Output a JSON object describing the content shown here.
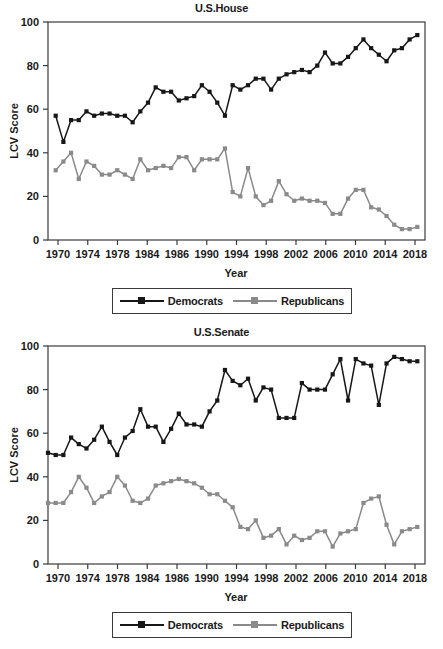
{
  "panels": [
    {
      "id": "house",
      "title": "U.S.House",
      "legend": {
        "dem": "Democrats",
        "rep": "Republicans"
      }
    },
    {
      "id": "senate",
      "title": "U.S.Senate",
      "legend": {
        "dem": "Democrats",
        "rep": "Republicans"
      }
    }
  ],
  "axis": {
    "xlabel": "Year",
    "ylabel": "LCV Score",
    "yticks": [
      "0",
      "20",
      "40",
      "60",
      "80",
      "100"
    ],
    "xticks": [
      "1970",
      "1974",
      "1978",
      "1984",
      "1986",
      "1990",
      "1994",
      "1998",
      "2002",
      "2006",
      "2010",
      "2014",
      "2018"
    ]
  },
  "colors": {
    "democrats": "#171717",
    "republicans": "#8a8a8a",
    "frame": "#3b3b3b",
    "text": "#1a1a1a",
    "background": "#ffffff"
  },
  "chart_data": [
    {
      "type": "line",
      "title": "U.S.House",
      "xlabel": "Year",
      "ylabel": "LCV Score",
      "ylim": [
        0,
        100
      ],
      "xlim": [
        1969,
        2018
      ],
      "grid": false,
      "legend_position": "bottom",
      "x": [
        1970,
        1971,
        1972,
        1973,
        1974,
        1975,
        1976,
        1977,
        1978,
        1979,
        1980,
        1981,
        1982,
        1983,
        1984,
        1985,
        1986,
        1987,
        1988,
        1989,
        1990,
        1991,
        1992,
        1993,
        1994,
        1995,
        1996,
        1997,
        1998,
        1999,
        2000,
        2001,
        2002,
        2003,
        2004,
        2005,
        2006,
        2007,
        2008,
        2009,
        2010,
        2011,
        2012,
        2013,
        2014,
        2015,
        2016,
        2017
      ],
      "series": [
        {
          "name": "Democrats",
          "color": "#171717",
          "values": [
            57,
            45,
            55,
            55,
            59,
            57,
            58,
            58,
            57,
            57,
            54,
            59,
            63,
            70,
            68,
            68,
            64,
            65,
            66,
            71,
            68,
            63,
            57,
            71,
            69,
            71,
            74,
            74,
            69,
            74,
            76,
            77,
            78,
            77,
            80,
            86,
            81,
            81,
            84,
            88,
            92,
            88,
            85,
            82,
            87,
            88,
            92,
            94
          ]
        },
        {
          "name": "Republicans",
          "color": "#8a8a8a",
          "values": [
            32,
            36,
            40,
            28,
            36,
            34,
            30,
            30,
            32,
            30,
            28,
            37,
            32,
            33,
            34,
            33,
            38,
            38,
            32,
            37,
            37,
            37,
            42,
            22,
            20,
            33,
            20,
            16,
            18,
            27,
            21,
            18,
            19,
            18,
            18,
            17,
            12,
            12,
            19,
            23,
            23,
            15,
            14,
            11,
            7,
            5,
            5,
            6
          ]
        }
      ]
    },
    {
      "type": "line",
      "title": "U.S.Senate",
      "xlabel": "Year",
      "ylabel": "LCV Score",
      "ylim": [
        0,
        100
      ],
      "xlim": [
        1969,
        2018
      ],
      "grid": false,
      "legend_position": "bottom",
      "x": [
        1969,
        1970,
        1971,
        1972,
        1973,
        1974,
        1975,
        1976,
        1977,
        1978,
        1979,
        1980,
        1981,
        1982,
        1983,
        1984,
        1985,
        1986,
        1987,
        1988,
        1989,
        1990,
        1991,
        1992,
        1993,
        1994,
        1995,
        1996,
        1997,
        1998,
        1999,
        2000,
        2001,
        2002,
        2003,
        2004,
        2005,
        2006,
        2007,
        2008,
        2009,
        2010,
        2011,
        2012,
        2013,
        2014,
        2015,
        2016,
        2017
      ],
      "series": [
        {
          "name": "Democrats",
          "color": "#171717",
          "values": [
            51,
            50,
            50,
            58,
            55,
            53,
            57,
            63,
            56,
            50,
            58,
            61,
            71,
            63,
            63,
            56,
            62,
            69,
            64,
            64,
            63,
            70,
            75,
            89,
            84,
            82,
            85,
            75,
            81,
            80,
            67,
            67,
            67,
            83,
            80,
            80,
            80,
            87,
            94,
            75,
            94,
            92,
            91,
            73,
            92,
            95,
            94,
            93,
            93
          ]
        },
        {
          "name": "Republicans",
          "color": "#8a8a8a",
          "values": [
            28,
            28,
            28,
            33,
            40,
            35,
            28,
            31,
            33,
            40,
            36,
            29,
            28,
            30,
            36,
            37,
            38,
            39,
            38,
            37,
            35,
            32,
            32,
            29,
            26,
            17,
            16,
            20,
            12,
            13,
            16,
            9,
            13,
            11,
            12,
            15,
            15,
            8,
            14,
            15,
            16,
            28,
            30,
            31,
            18,
            9,
            15,
            16,
            17
          ]
        }
      ]
    }
  ]
}
